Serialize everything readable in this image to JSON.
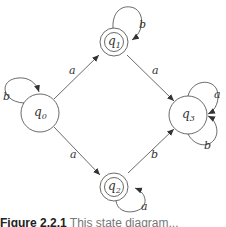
{
  "diagram": {
    "type": "finite-automaton",
    "states": [
      {
        "id": "q0",
        "name": "q",
        "sub": "0",
        "accepting": false,
        "cx": 40,
        "cy": 113
      },
      {
        "id": "q1",
        "name": "q",
        "sub": "1",
        "accepting": true,
        "cx": 114,
        "cy": 42
      },
      {
        "id": "q2",
        "name": "q",
        "sub": "2",
        "accepting": true,
        "cx": 114,
        "cy": 187
      },
      {
        "id": "q3",
        "name": "q",
        "sub": "3",
        "accepting": false,
        "cx": 188,
        "cy": 115
      }
    ],
    "transitions": [
      {
        "from": "q0",
        "to": "q0",
        "label": "b"
      },
      {
        "from": "q0",
        "to": "q1",
        "label": "a"
      },
      {
        "from": "q0",
        "to": "q2",
        "label": "a"
      },
      {
        "from": "q1",
        "to": "q1",
        "label": "b"
      },
      {
        "from": "q1",
        "to": "q3",
        "label": "a"
      },
      {
        "from": "q2",
        "to": "q2",
        "label": "a"
      },
      {
        "from": "q2",
        "to": "q3",
        "label": "b"
      },
      {
        "from": "q3",
        "to": "q3",
        "label": "a"
      },
      {
        "from": "q3",
        "to": "q3",
        "label": "b"
      }
    ]
  },
  "caption": {
    "prefix": "Figure 2.2.1",
    "rest": "  This state diagram..."
  }
}
